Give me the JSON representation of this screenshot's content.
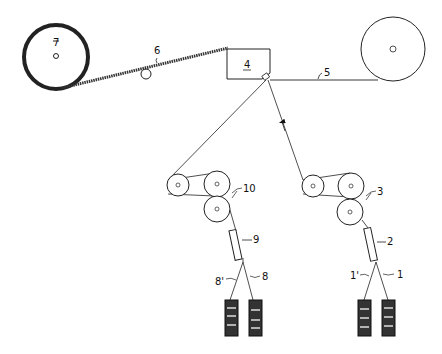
{
  "diagram": {
    "labels": {
      "supply_yarn_1": "1",
      "supply_yarn_1p": "1'",
      "heater_2": "2",
      "feed_rolls_3": "3",
      "nozzle_4": "4",
      "yarn_5": "5",
      "yarn_6": "6",
      "takeup_7": "7",
      "supply_yarn_8": "8",
      "supply_yarn_8p": "8'",
      "heater_9": "9",
      "feed_rolls_10": "10"
    }
  }
}
